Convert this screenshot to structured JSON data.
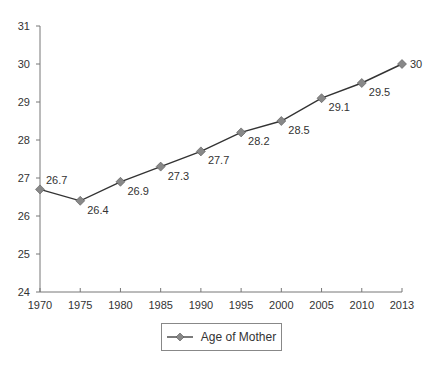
{
  "chart_data": {
    "type": "line",
    "title": "",
    "xlabel": "",
    "ylabel": "",
    "categories": [
      "1970",
      "1975",
      "1980",
      "1985",
      "1990",
      "1995",
      "2000",
      "2005",
      "2010",
      "2013"
    ],
    "series": [
      {
        "name": "Age of Mother",
        "values": [
          26.7,
          26.4,
          26.9,
          27.3,
          27.7,
          28.2,
          28.5,
          29.1,
          29.5,
          30
        ],
        "data_labels": [
          "26.7",
          "26.4",
          "26.9",
          "27.3",
          "27.7",
          "28.2",
          "28.5",
          "29.1",
          "29.5",
          "30"
        ],
        "line_color": "#333333",
        "marker": "diamond",
        "marker_color": "#888888"
      }
    ],
    "ylim": [
      24,
      31
    ],
    "yticks": [
      "24",
      "25",
      "26",
      "27",
      "28",
      "29",
      "30",
      "31"
    ],
    "grid": false,
    "legend_position": "bottom"
  },
  "legend": {
    "label": "Age of Mother"
  }
}
